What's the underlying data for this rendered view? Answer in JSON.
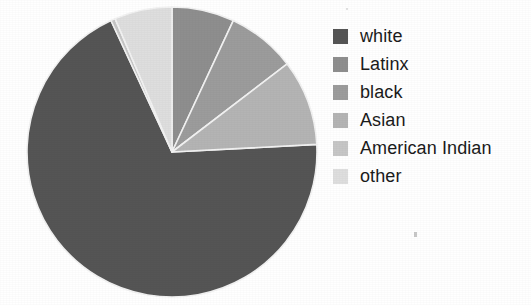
{
  "chart_data": {
    "type": "pie",
    "title": "",
    "subtitle": "",
    "xlabel": "",
    "ylabel": "",
    "grid": false,
    "legend_position": "right",
    "start_angle_deg": 0,
    "direction": "clockwise",
    "center": {
      "x": 172,
      "y": 152
    },
    "radius": 145,
    "categories": [
      "white",
      "Latinx",
      "black",
      "Asian",
      "American Indian",
      "other"
    ],
    "values": [
      69.0,
      7.0,
      7.7,
      9.6,
      0.5,
      6.2
    ],
    "unit": "percent",
    "slice_boundaries_deg_clockwise_from_12": [
      0,
      25,
      52.6,
      87,
      335.1,
      335.4,
      360
    ],
    "colors": [
      "#555555",
      "#8e8e8e",
      "#9c9c9c",
      "#b4b4b4",
      "#c6c6c6",
      "#dedede"
    ],
    "slices": [
      {
        "label": "white",
        "value": 69.0,
        "color": "#555555",
        "start_deg": 87.0,
        "end_deg": 335.1
      },
      {
        "label": "Latinx",
        "value": 7.0,
        "color": "#8e8e8e",
        "start_deg": 0.0,
        "end_deg": 25.0
      },
      {
        "label": "black",
        "value": 7.7,
        "color": "#9c9c9c",
        "start_deg": 25.0,
        "end_deg": 52.6
      },
      {
        "label": "Asian",
        "value": 9.6,
        "color": "#b4b4b4",
        "start_deg": 52.6,
        "end_deg": 87.0
      },
      {
        "label": "American Indian",
        "value": 0.5,
        "color": "#c6c6c6",
        "start_deg": 335.1,
        "end_deg": 336.9
      },
      {
        "label": "other",
        "value": 6.2,
        "color": "#dedede",
        "start_deg": 336.9,
        "end_deg": 360.0
      }
    ],
    "edge_color": "#f2f2f2",
    "edge_width": 1.6,
    "background": "#ffffff"
  },
  "legend": {
    "items": [
      {
        "label": "white",
        "color": "#555555",
        "swatch_name": "legend-swatch-white"
      },
      {
        "label": "Latinx",
        "color": "#8e8e8e",
        "swatch_name": "legend-swatch-latinx"
      },
      {
        "label": "black",
        "color": "#9c9c9c",
        "swatch_name": "legend-swatch-black"
      },
      {
        "label": "Asian",
        "color": "#b4b4b4",
        "swatch_name": "legend-swatch-asian"
      },
      {
        "label": "American Indian",
        "color": "#c6c6c6",
        "swatch_name": "legend-swatch-american-indian"
      },
      {
        "label": "other",
        "color": "#dedede",
        "swatch_name": "legend-swatch-other"
      }
    ]
  }
}
